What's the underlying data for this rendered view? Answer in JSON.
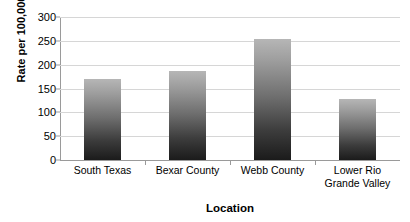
{
  "chart_data": {
    "type": "bar",
    "title": "",
    "xlabel": "Location",
    "ylabel": "Rate per 100,000",
    "categories": [
      "South Texas",
      "Bexar County",
      "Webb County",
      "Lower Rio Grande Valley"
    ],
    "values": [
      170,
      187,
      254,
      128
    ],
    "series": [
      {
        "name": "Rate per 100,000",
        "values": [
          170,
          187,
          254,
          128
        ]
      }
    ],
    "ylim": [
      0,
      300
    ],
    "y_ticks": [
      0,
      50,
      100,
      150,
      200,
      250,
      300
    ],
    "y_tick_labels": [
      "0",
      "50",
      "100",
      "150",
      "200",
      "250",
      "300"
    ],
    "grid": true,
    "grid_axis": "y",
    "legend": false,
    "legend_position": "none",
    "bar_fill_top_color": "#b6b6b6",
    "bar_fill_bottom_color": "#1b1b1b",
    "gridline_color": "#d6d6d6",
    "axis_color": "#9a9a9a",
    "background_color": "#ffffff",
    "text_color": "#000000"
  }
}
